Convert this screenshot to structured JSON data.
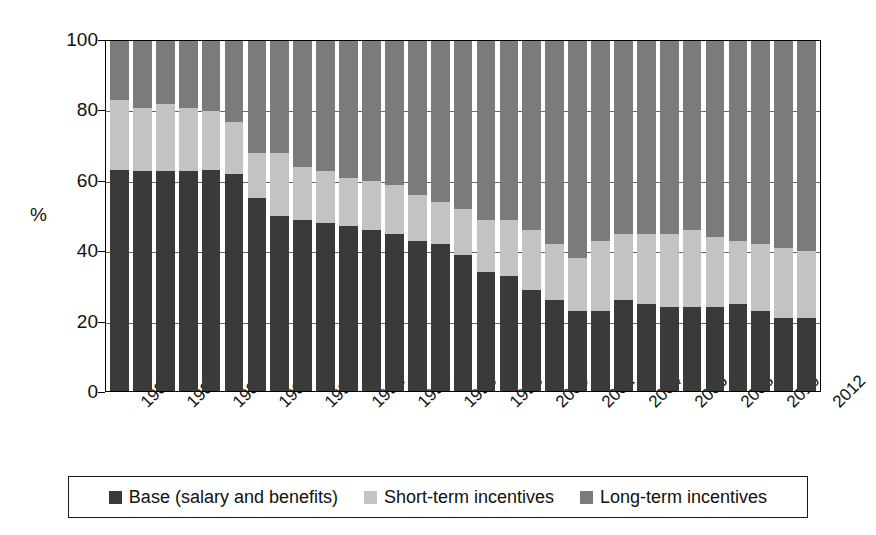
{
  "chart_data": {
    "type": "bar",
    "stacked": true,
    "title": "",
    "xlabel": "",
    "ylabel": "%",
    "ylim": [
      0,
      100
    ],
    "yticks": [
      0,
      20,
      40,
      60,
      80,
      100
    ],
    "grid": true,
    "legend_position": "bottom",
    "x": [
      1982,
      1983,
      1984,
      1985,
      1986,
      1987,
      1988,
      1989,
      1990,
      1991,
      1992,
      1993,
      1994,
      1995,
      1996,
      1997,
      1998,
      1999,
      2000,
      2001,
      2002,
      2003,
      2004,
      2005,
      2006,
      2007,
      2008,
      2009,
      2010,
      2011,
      2012
    ],
    "xtick_labels": [
      "1982",
      "1984",
      "1986",
      "1988",
      "1990",
      "1992",
      "1994",
      "1996",
      "1998",
      "2000",
      "2002",
      "2004",
      "2006",
      "2008",
      "2010",
      "2012"
    ],
    "xtick_indices": [
      0,
      2,
      4,
      6,
      8,
      10,
      12,
      14,
      16,
      18,
      20,
      22,
      24,
      26,
      28,
      30
    ],
    "series": [
      {
        "name": "Base (salary and benefits)",
        "color": "#3a3a3a",
        "values": [
          63,
          63,
          63,
          63,
          63,
          62,
          55,
          50,
          49,
          48,
          47,
          46,
          45,
          43,
          42,
          39,
          34,
          33,
          29,
          26,
          23,
          23,
          26,
          25,
          24,
          24,
          24,
          25,
          23,
          21,
          21
        ]
      },
      {
        "name": "Short-term incentives",
        "color": "#c3c3c3",
        "values": [
          20,
          18,
          19,
          18,
          17,
          15,
          13,
          18,
          15,
          15,
          14,
          14,
          14,
          13,
          12,
          13,
          15,
          16,
          17,
          16,
          15,
          20,
          19,
          20,
          21,
          22,
          20,
          18,
          19,
          20,
          19
        ]
      },
      {
        "name": "Long-term incentives",
        "color": "#7b7b7b",
        "values": [
          17,
          19,
          18,
          19,
          20,
          23,
          32,
          32,
          36,
          37,
          39,
          40,
          41,
          44,
          46,
          48,
          51,
          51,
          54,
          58,
          62,
          57,
          55,
          55,
          55,
          54,
          56,
          57,
          58,
          59,
          60
        ]
      }
    ]
  },
  "legend": {
    "items": [
      {
        "label": "Base (salary and benefits)",
        "color": "#3a3a3a",
        "swatch_name": "legend-swatch-base"
      },
      {
        "label": "Short-term incentives",
        "color": "#c3c3c3",
        "swatch_name": "legend-swatch-short-term"
      },
      {
        "label": "Long-term incentives",
        "color": "#7b7b7b",
        "swatch_name": "legend-swatch-long-term"
      }
    ]
  }
}
